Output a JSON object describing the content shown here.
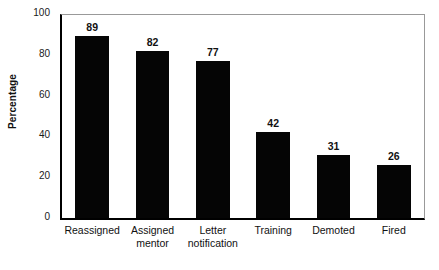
{
  "chart_data": {
    "type": "bar",
    "title": "",
    "subtitle": "",
    "xlabel": "",
    "ylabel": "Percentage",
    "ylim": [
      0,
      100
    ],
    "yticks": [
      0,
      20,
      40,
      60,
      80,
      100
    ],
    "grid": false,
    "legend": null,
    "bar_color": "#050505",
    "axis_color": "#000000",
    "frame_color": "#999999",
    "tick_color": "#8c8c8c",
    "categories": [
      "Reassigned",
      "Assigned mentor",
      "Letter notification",
      "Training",
      "Demoted",
      "Fired"
    ],
    "category_lines": [
      [
        "Reassigned"
      ],
      [
        "Assigned",
        "mentor"
      ],
      [
        "Letter",
        "notification"
      ],
      [
        "Training"
      ],
      [
        "Demoted"
      ],
      [
        "Fired"
      ]
    ],
    "values": [
      89,
      82,
      77,
      42,
      31,
      26
    ],
    "value_labels": [
      "89",
      "82",
      "77",
      "42",
      "31",
      "26"
    ],
    "ytick_labels": [
      "0",
      "20",
      "40",
      "60",
      "80",
      "100"
    ]
  }
}
